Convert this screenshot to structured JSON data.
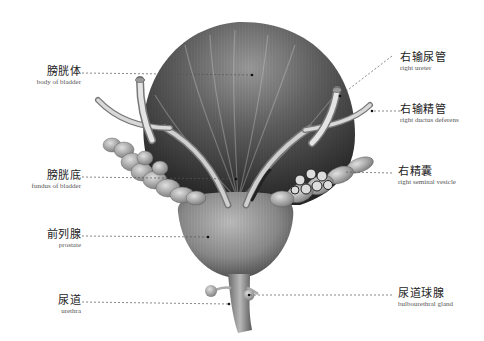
{
  "figure": {
    "title": "",
    "labels": [
      {
        "id": "body-of-bladder",
        "zh": "膀胱体",
        "en": "body of bladder",
        "side": "left"
      },
      {
        "id": "fundus-of-bladder",
        "zh": "膀胱底",
        "en": "fundus of bladder",
        "side": "left"
      },
      {
        "id": "prostate",
        "zh": "前列腺",
        "en": "prostate",
        "side": "left"
      },
      {
        "id": "urethra",
        "zh": "尿道",
        "en": "urethra",
        "side": "left"
      },
      {
        "id": "right-ureter",
        "zh": "右输尿管",
        "en": "right ureter",
        "side": "right"
      },
      {
        "id": "right-ductus-deferens",
        "zh": "右输精管",
        "en": "right ductus deferens",
        "side": "right"
      },
      {
        "id": "right-seminal-vesicle",
        "zh": "右精囊",
        "en": "right seminal vesicle",
        "side": "right"
      },
      {
        "id": "bulbourethral-gland",
        "zh": "尿道球腺",
        "en": "bulbourethral gland",
        "side": "right"
      }
    ],
    "colors": {
      "background": "#ffffff",
      "bladder_dark": "#3a3a3a",
      "bladder_mid": "#6e6e6e",
      "bladder_light": "#bdbdbd",
      "tube": "#c8c8c8",
      "leader_line": "#555555",
      "text": "#222222"
    }
  }
}
